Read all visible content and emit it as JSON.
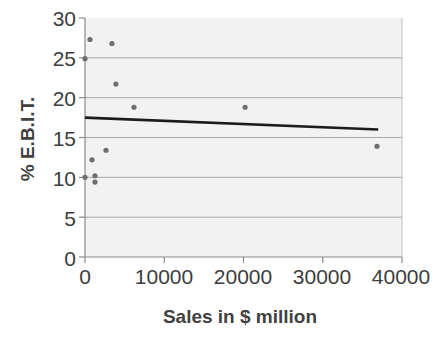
{
  "chart_data": {
    "type": "scatter",
    "title": "",
    "xlabel": "Sales in $ million",
    "ylabel": "% E.B.I.T.",
    "xlim": [
      0,
      40000
    ],
    "ylim": [
      0,
      30
    ],
    "xticks": [
      "0",
      "10000",
      "20000",
      "30000",
      "40000"
    ],
    "xtick_values": [
      0,
      10000,
      20000,
      30000,
      40000
    ],
    "yticks": [
      "0",
      "5",
      "10",
      "15",
      "20",
      "25",
      "30"
    ],
    "ytick_values": [
      0,
      5,
      10,
      15,
      20,
      25,
      30
    ],
    "grid": "horizontal",
    "legend": "none",
    "marker_color": "#6e6e6e",
    "trendline_color": "#1c1c1c",
    "gridline_color": "#a8a8a8",
    "plot_background": "#f2f2f2",
    "points": [
      {
        "x": 0,
        "y": 24.9
      },
      {
        "x": 0,
        "y": 10.0
      },
      {
        "x": 630,
        "y": 27.3
      },
      {
        "x": 880,
        "y": 12.2
      },
      {
        "x": 1260,
        "y": 10.2
      },
      {
        "x": 1260,
        "y": 9.4
      },
      {
        "x": 3400,
        "y": 26.8
      },
      {
        "x": 3900,
        "y": 21.7
      },
      {
        "x": 2650,
        "y": 13.4
      },
      {
        "x": 6180,
        "y": 18.8
      },
      {
        "x": 20200,
        "y": 18.8
      },
      {
        "x": 36850,
        "y": 13.9
      }
    ],
    "trendline": {
      "name": "linear fit",
      "x_start": 0,
      "y_start": 17.5,
      "x_end": 37000,
      "y_end": 16.0
    }
  },
  "axis": {
    "x_label": "Sales in $ million",
    "y_label": "% E.B.I.T."
  }
}
